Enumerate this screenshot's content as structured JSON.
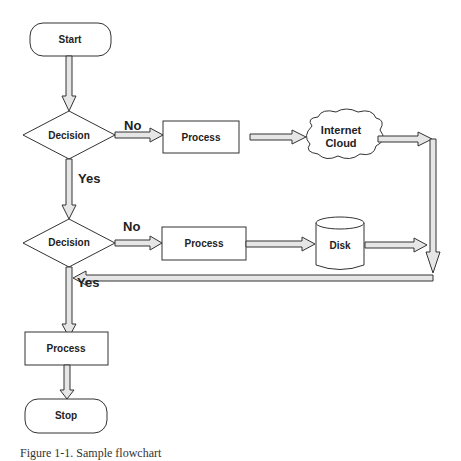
{
  "diagram": {
    "type": "flowchart",
    "nodes": {
      "start": "Start",
      "decision1": "Decision",
      "process1": "Process",
      "cloud_line1": "Internet",
      "cloud_line2": "Cloud",
      "decision2": "Decision",
      "process2": "Process",
      "disk": "Disk",
      "process3": "Process",
      "stop": "Stop"
    },
    "edge_labels": {
      "d1_no": "No",
      "d1_yes": "Yes",
      "d2_no": "No",
      "d2_yes": "Yes"
    },
    "colors": {
      "stroke": "#333333",
      "arrow_fill": "#e6e6e6"
    }
  },
  "caption": "Figure 1-1. Sample flowchart"
}
